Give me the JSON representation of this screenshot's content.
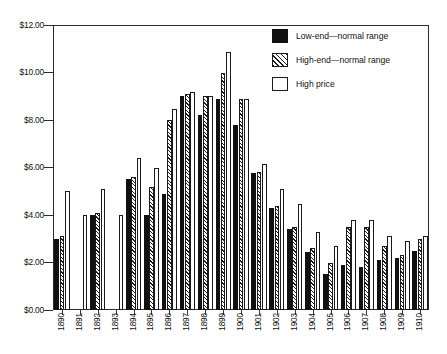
{
  "chart_data": {
    "type": "bar",
    "title": "",
    "subtitle": "",
    "xlabel": "",
    "ylabel": "",
    "ylim": [
      0,
      12
    ],
    "ytick_values": [
      0,
      2,
      4,
      6,
      8,
      10,
      12
    ],
    "ytick_labels": [
      "$0.00",
      "$2.00",
      "$4.00",
      "$6.00",
      "$8.00",
      "$10.00",
      "$12.00"
    ],
    "grid": false,
    "legend_position": "top-right",
    "categories": [
      "1890",
      "1891",
      "1892",
      "1893",
      "1894",
      "1895",
      "1896",
      "1897",
      "1898",
      "1899",
      "1900",
      "1901",
      "1902",
      "1903",
      "1904",
      "1905",
      "1906",
      "1907",
      "1908",
      "1909",
      "1910"
    ],
    "series": [
      {
        "name": "Low-end—normal range",
        "style": "solid-black",
        "color": "#111111",
        "values": [
          3.0,
          null,
          4.0,
          null,
          5.5,
          4.0,
          4.9,
          9.0,
          8.2,
          8.9,
          7.8,
          5.75,
          4.3,
          3.4,
          2.45,
          1.5,
          1.9,
          1.8,
          2.1,
          2.2,
          2.5
        ]
      },
      {
        "name": "High-end—normal range",
        "style": "diagonal-hatch",
        "color": "#1d1d1d",
        "values": [
          3.1,
          null,
          4.1,
          null,
          5.6,
          5.2,
          8.0,
          9.1,
          9.0,
          10.0,
          8.9,
          5.8,
          4.4,
          3.5,
          2.6,
          2.0,
          3.5,
          3.5,
          2.7,
          2.3,
          3.0
        ]
      },
      {
        "name": "High price",
        "style": "white-outline",
        "color": "#ffffff",
        "values": [
          5.0,
          4.0,
          5.1,
          4.0,
          6.4,
          6.0,
          8.45,
          9.2,
          9.0,
          10.85,
          8.9,
          6.15,
          5.1,
          4.45,
          3.3,
          2.7,
          3.8,
          3.8,
          3.1,
          2.9,
          3.1
        ]
      }
    ],
    "legend_entries": [
      {
        "label": "Low-end—normal range",
        "swatch": "solid-black"
      },
      {
        "label": "High-end—normal range",
        "swatch": "diagonal-hatch"
      },
      {
        "label": "High price",
        "swatch": "white-outline"
      }
    ]
  }
}
